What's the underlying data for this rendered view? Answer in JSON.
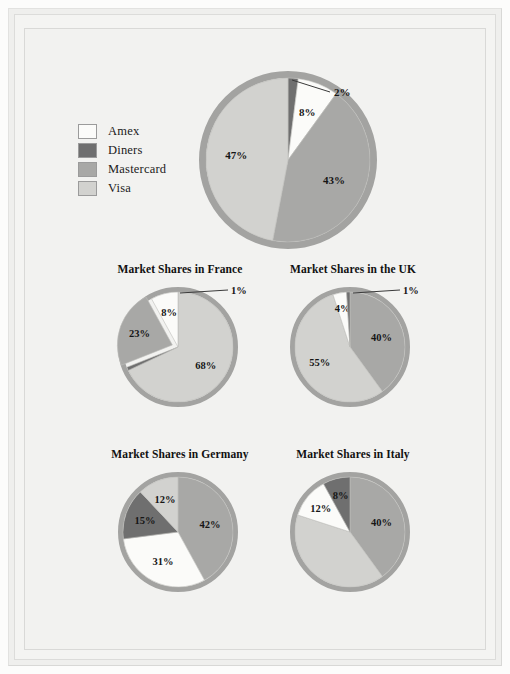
{
  "document": {
    "title": "Credit Card Market Shares",
    "background_color": "#f2f2f0",
    "frame_color": "#efefed"
  },
  "legend": {
    "items": [
      {
        "label": "Amex",
        "color": "#fbfbf9"
      },
      {
        "label": "Diners",
        "color": "#6f6f6f"
      },
      {
        "label": "Mastercard",
        "color": "#a8a8a6"
      },
      {
        "label": "Visa",
        "color": "#d2d2cf"
      }
    ]
  },
  "chart_data": [
    {
      "type": "pie",
      "id": "overall",
      "title": "",
      "categories": [
        "Diners",
        "Amex",
        "Mastercard",
        "Visa"
      ],
      "values": [
        2,
        8,
        43,
        47
      ],
      "labels": [
        "2%",
        "8%",
        "43%",
        "47%"
      ],
      "colors": [
        "#6f6f6f",
        "#fbfbf9",
        "#a8a8a6",
        "#d2d2cf"
      ],
      "start_angle": 0,
      "direction": "clockwise",
      "rim_color": "#a3a3a1",
      "callout_labels": [
        "2%"
      ],
      "legend_position": "left"
    },
    {
      "type": "pie",
      "id": "france",
      "title": "Market Shares in France",
      "categories": [
        "Visa",
        "Diners",
        "Mastercard",
        "Amex"
      ],
      "values": [
        68,
        1,
        23,
        8
      ],
      "labels": [
        "68%",
        "1%",
        "23%",
        "8%"
      ],
      "colors": [
        "#d2d2cf",
        "#6f6f6f",
        "#a8a8a6",
        "#fbfbf9"
      ],
      "exploded": [
        "Mastercard"
      ],
      "start_angle": 0,
      "direction": "clockwise",
      "rim_color": "#a3a3a1",
      "callout_labels": [
        "1%"
      ]
    },
    {
      "type": "pie",
      "id": "uk",
      "title": "Market Shares in the UK",
      "categories": [
        "Mastercard",
        "Visa",
        "Amex",
        "Diners"
      ],
      "values": [
        40,
        55,
        4,
        1
      ],
      "labels": [
        "40%",
        "55%",
        "4%",
        "1%"
      ],
      "colors": [
        "#a8a8a6",
        "#d2d2cf",
        "#fbfbf9",
        "#6f6f6f"
      ],
      "start_angle": 0,
      "direction": "clockwise",
      "rim_color": "#a3a3a1",
      "callout_labels": [
        "1%"
      ]
    },
    {
      "type": "pie",
      "id": "germany",
      "title": "Market Shares in Germany",
      "categories": [
        "Mastercard",
        "Amex",
        "Diners",
        "Visa"
      ],
      "values": [
        42,
        31,
        15,
        12
      ],
      "labels": [
        "42%",
        "31%",
        "15%",
        "12%"
      ],
      "colors": [
        "#a8a8a6",
        "#fbfbf9",
        "#6f6f6f",
        "#d2d2cf"
      ],
      "start_angle": 0,
      "direction": "clockwise",
      "rim_color": "#a3a3a1",
      "callout_labels": []
    },
    {
      "type": "pie",
      "id": "italy",
      "title": "Market Shares in Italy",
      "categories": [
        "Mastercard",
        "Visa",
        "Amex",
        "Diners"
      ],
      "values": [
        40,
        40,
        12,
        8
      ],
      "labels": [
        "40%",
        "40%",
        "12%",
        "8%"
      ],
      "colors": [
        "#a8a8a6",
        "#d2d2cf",
        "#fbfbf9",
        "#6f6f6f"
      ],
      "start_angle": 0,
      "direction": "clockwise",
      "rim_color": "#a3a3a1",
      "callout_labels": []
    }
  ]
}
